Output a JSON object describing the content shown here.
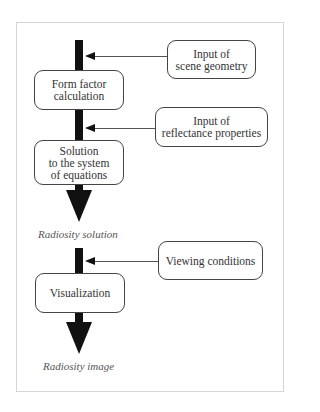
{
  "diagram": {
    "type": "flowchart",
    "title": "",
    "main_steps": [
      {
        "id": "form_factor",
        "label": "Form factor\ncalculation"
      },
      {
        "id": "solution",
        "label": "Solution\nto the system\nof equations"
      },
      {
        "id": "visualization",
        "label": "Visualization"
      }
    ],
    "inputs": [
      {
        "id": "scene_geometry",
        "label": "Input of\nscene geometry",
        "feeds": "form_factor"
      },
      {
        "id": "reflectance",
        "label": "Input of\nreflectance properties",
        "feeds": "solution"
      },
      {
        "id": "viewing",
        "label": "Viewing conditions",
        "feeds": "visualization"
      }
    ],
    "outputs": [
      {
        "id": "radiosity_solution",
        "label": "Radiosity solution"
      },
      {
        "id": "radiosity_image",
        "label": "Radiosity image"
      }
    ],
    "colors": {
      "arrow": "#111111",
      "box_border": "#444444",
      "frame_border": "#d6d6d6",
      "text": "#333333"
    }
  }
}
